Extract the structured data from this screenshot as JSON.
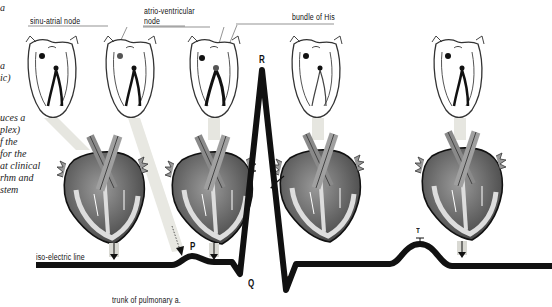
{
  "labels": {
    "sa_node": "sinu-atrial node",
    "av_node_line1": "atrio-ventricular",
    "av_node_line2": "node",
    "bundle_his": "bundle of His",
    "iso_line": "iso-electric line",
    "pulmonary": "trunk of pulmonary a."
  },
  "side_text": {
    "lines": [
      "a",
      "ic)",
      "",
      "uces a",
      "plex)",
      "f the",
      "for the",
      "at clinical",
      "rhm and",
      "stem"
    ]
  },
  "ecg_waves": {
    "P": "P",
    "Q": "Q",
    "R": "R",
    "S": "S",
    "T": "T"
  },
  "colors": {
    "ink": "#111111",
    "heart_dark": "#4a4a4a",
    "heart_mid": "#7a7a7a",
    "heart_light": "#bdbdbd",
    "arrow_band": "#e2e2dc"
  }
}
